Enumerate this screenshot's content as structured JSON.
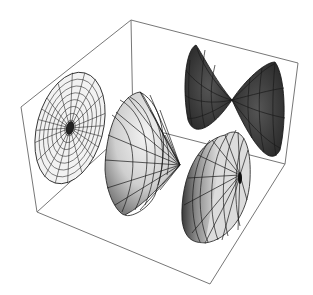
{
  "figure": {
    "type": "3d-surface-plot",
    "background": "#ffffff",
    "box_color": "#777777",
    "mesh_color": "#1a1a1a",
    "bounding_box": {
      "corners": {
        "top_back": [
          131,
          20
        ],
        "top_right": [
          298,
          63
        ],
        "top_left": [
          21,
          107
        ],
        "bottom_left": [
          37,
          212
        ],
        "bottom_front": [
          210,
          284
        ],
        "bottom_right": [
          285,
          164
        ]
      }
    },
    "surfaces": [
      {
        "name": "flat-disk",
        "description": "Flat radial disk with fine mesh",
        "fill": "#f2f2f2",
        "center": [
          70,
          128
        ]
      },
      {
        "name": "cone-left",
        "description": "Light gray cone opening toward viewer",
        "fill": "#c8c8c8",
        "apex": [
          180,
          165
        ]
      },
      {
        "name": "dark-double-lobe",
        "description": "Dark bowtie-shaped surface",
        "fill": "#404040",
        "pinch": [
          232,
          100
        ]
      },
      {
        "name": "cone-front",
        "description": "Shaded cone with apex near center",
        "fill": "#b5b5b5",
        "apex": [
          240,
          175
        ]
      }
    ]
  }
}
